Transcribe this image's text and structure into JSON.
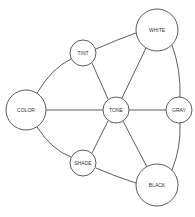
{
  "diagram": {
    "title": "",
    "colors": {
      "stroke": "#4a4a4a",
      "fill": "#ffffff",
      "text": "#333333"
    },
    "nodes": [
      {
        "id": "color",
        "label": "COLOR",
        "cx": 26,
        "cy": 110,
        "r": 20
      },
      {
        "id": "tint",
        "label": "TINT",
        "cx": 83,
        "cy": 53,
        "r": 13
      },
      {
        "id": "white",
        "label": "WHITE",
        "cx": 157,
        "cy": 30,
        "r": 21
      },
      {
        "id": "tone",
        "label": "TONE",
        "cx": 116,
        "cy": 110,
        "r": 13
      },
      {
        "id": "gray",
        "label": "GRAY",
        "cx": 179,
        "cy": 110,
        "r": 13
      },
      {
        "id": "shade",
        "label": "SHADE",
        "cx": 83,
        "cy": 163,
        "r": 13
      },
      {
        "id": "black",
        "label": "BLACK",
        "cx": 157,
        "cy": 185,
        "r": 21
      }
    ],
    "edges": [
      {
        "from": "color",
        "to": "tint",
        "type": "curve"
      },
      {
        "from": "tint",
        "to": "white",
        "type": "curve"
      },
      {
        "from": "white",
        "to": "gray",
        "type": "curve"
      },
      {
        "from": "gray",
        "to": "black",
        "type": "curve"
      },
      {
        "from": "black",
        "to": "shade",
        "type": "curve"
      },
      {
        "from": "shade",
        "to": "color",
        "type": "curve"
      },
      {
        "from": "color",
        "to": "tone",
        "type": "line"
      },
      {
        "from": "tint",
        "to": "tone",
        "type": "line"
      },
      {
        "from": "white",
        "to": "tone",
        "type": "line"
      },
      {
        "from": "tone",
        "to": "gray",
        "type": "line"
      },
      {
        "from": "tone",
        "to": "black",
        "type": "line"
      },
      {
        "from": "tone",
        "to": "shade",
        "type": "line"
      }
    ]
  }
}
